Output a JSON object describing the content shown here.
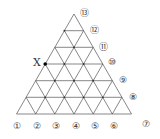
{
  "diagram": {
    "point_label": "X",
    "bottom_labels": [
      "①",
      "②",
      "③",
      "④",
      "⑤",
      "⑥"
    ],
    "right_labels": [
      "⑦",
      "⑧",
      "⑨",
      "⑩",
      "⑪",
      "⑫",
      "⑬"
    ],
    "divisions": 6,
    "line_color": "#555555"
  }
}
